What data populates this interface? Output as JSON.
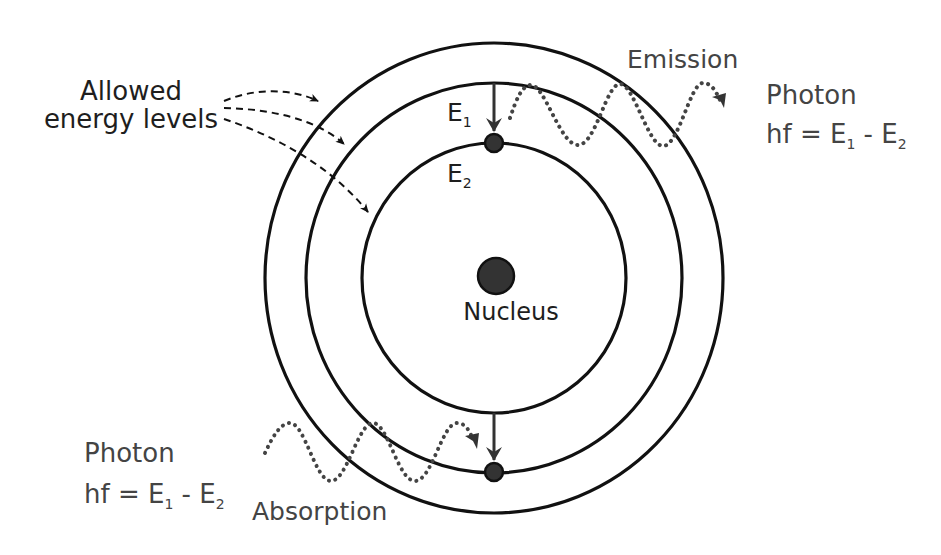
{
  "diagram": {
    "labels": {
      "allowed_line1": "Allowed",
      "allowed_line2": "energy levels",
      "emission": "Emission",
      "absorption": "Absorption",
      "nucleus": "Nucleus",
      "e1_main": "E",
      "e1_sub": "1",
      "e2_main": "E",
      "e2_sub": "2"
    },
    "photon_emission": {
      "title": "Photon",
      "formula_prefix": "hf = E",
      "sub1": "1",
      "formula_mid": " - E",
      "sub2": "2"
    },
    "photon_absorption": {
      "title": "Photon",
      "formula_prefix": "hf = E",
      "sub1": "1",
      "formula_mid": " - E",
      "sub2": "2"
    },
    "colors": {
      "line": "#111111",
      "text": "#1e1e1e",
      "text_gray": "#444444",
      "wave": "#444444",
      "nucleus_fill": "#333333"
    }
  }
}
